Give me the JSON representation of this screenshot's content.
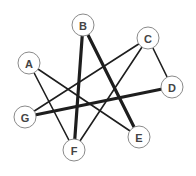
{
  "diagram": {
    "type": "graph",
    "node_radius": 11,
    "colors": {
      "edge": "#1e1e1e",
      "node_fill": "#ffffff",
      "node_stroke": "#8a8a8a",
      "label": "#444444"
    },
    "nodes": [
      {
        "id": "A",
        "label": "A",
        "x": 29,
        "y": 63
      },
      {
        "id": "B",
        "label": "B",
        "x": 83,
        "y": 25
      },
      {
        "id": "C",
        "label": "C",
        "x": 148,
        "y": 38
      },
      {
        "id": "D",
        "label": "D",
        "x": 172,
        "y": 87
      },
      {
        "id": "E",
        "label": "E",
        "x": 139,
        "y": 137
      },
      {
        "id": "F",
        "label": "F",
        "x": 74,
        "y": 150
      },
      {
        "id": "G",
        "label": "G",
        "x": 25,
        "y": 117
      }
    ],
    "edges": [
      {
        "from": "A",
        "to": "F",
        "weight": "thin"
      },
      {
        "from": "A",
        "to": "E",
        "weight": "thin"
      },
      {
        "from": "B",
        "to": "F",
        "weight": "thick"
      },
      {
        "from": "B",
        "to": "E",
        "weight": "thick"
      },
      {
        "from": "C",
        "to": "G",
        "weight": "thin"
      },
      {
        "from": "C",
        "to": "F",
        "weight": "thin"
      },
      {
        "from": "C",
        "to": "D",
        "weight": "thin"
      },
      {
        "from": "G",
        "to": "D",
        "weight": "thick"
      }
    ]
  }
}
